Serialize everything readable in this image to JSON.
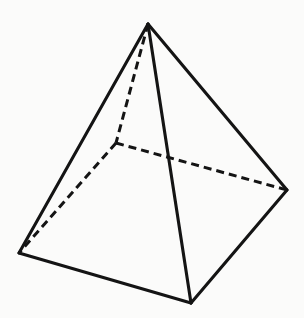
{
  "figure": {
    "name": "square-pyramid-wireframe",
    "canvas": {
      "width": 304,
      "height": 318,
      "background": "#fbfbfa"
    },
    "stroke": {
      "color": "#141414",
      "width_visible": 3.1,
      "width_hidden": 3.0
    },
    "dash": {
      "dash_length": 8,
      "gap_length": 5
    },
    "vertices": [
      {
        "id": "apex",
        "label": "Apex",
        "x": 148,
        "y": 24,
        "hidden": false
      },
      {
        "id": "front",
        "label": "Front base corner",
        "x": 191,
        "y": 303,
        "hidden": false
      },
      {
        "id": "left",
        "label": "Left base corner",
        "x": 19,
        "y": 253,
        "hidden": false
      },
      {
        "id": "right",
        "label": "Right base corner",
        "x": 287,
        "y": 190,
        "hidden": false
      },
      {
        "id": "back",
        "label": "Back base corner",
        "x": 116,
        "y": 143,
        "hidden": true
      }
    ],
    "edges": [
      {
        "id": "apex-left",
        "from": "apex",
        "to": "left",
        "style": "solid",
        "label": "Lateral edge apex to left"
      },
      {
        "id": "apex-right",
        "from": "apex",
        "to": "right",
        "style": "solid",
        "label": "Lateral edge apex to right"
      },
      {
        "id": "apex-front",
        "from": "apex",
        "to": "front",
        "style": "solid",
        "label": "Lateral edge apex to front"
      },
      {
        "id": "apex-back",
        "from": "apex",
        "to": "back",
        "style": "dashed",
        "label": "Hidden lateral edge apex to back"
      },
      {
        "id": "left-front",
        "from": "left",
        "to": "front",
        "style": "solid",
        "label": "Base edge left to front"
      },
      {
        "id": "front-right",
        "from": "front",
        "to": "right",
        "style": "solid",
        "label": "Base edge front to right"
      },
      {
        "id": "back-left",
        "from": "back",
        "to": "left",
        "style": "dashed",
        "label": "Hidden base edge back to left"
      },
      {
        "id": "back-right",
        "from": "back",
        "to": "right",
        "style": "dashed",
        "label": "Hidden base edge back to right"
      }
    ]
  }
}
